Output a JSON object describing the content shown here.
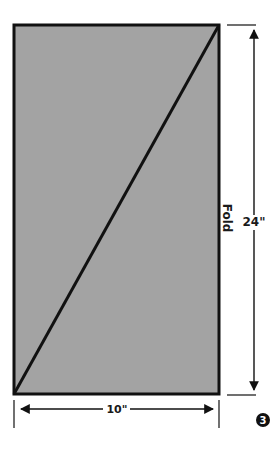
{
  "diagram": {
    "panel": {
      "fill": "#a3a3a3",
      "stroke": "#111111"
    },
    "labels": {
      "height": "24\"",
      "width": "10\"",
      "fold": "Fold",
      "step": "3"
    }
  }
}
